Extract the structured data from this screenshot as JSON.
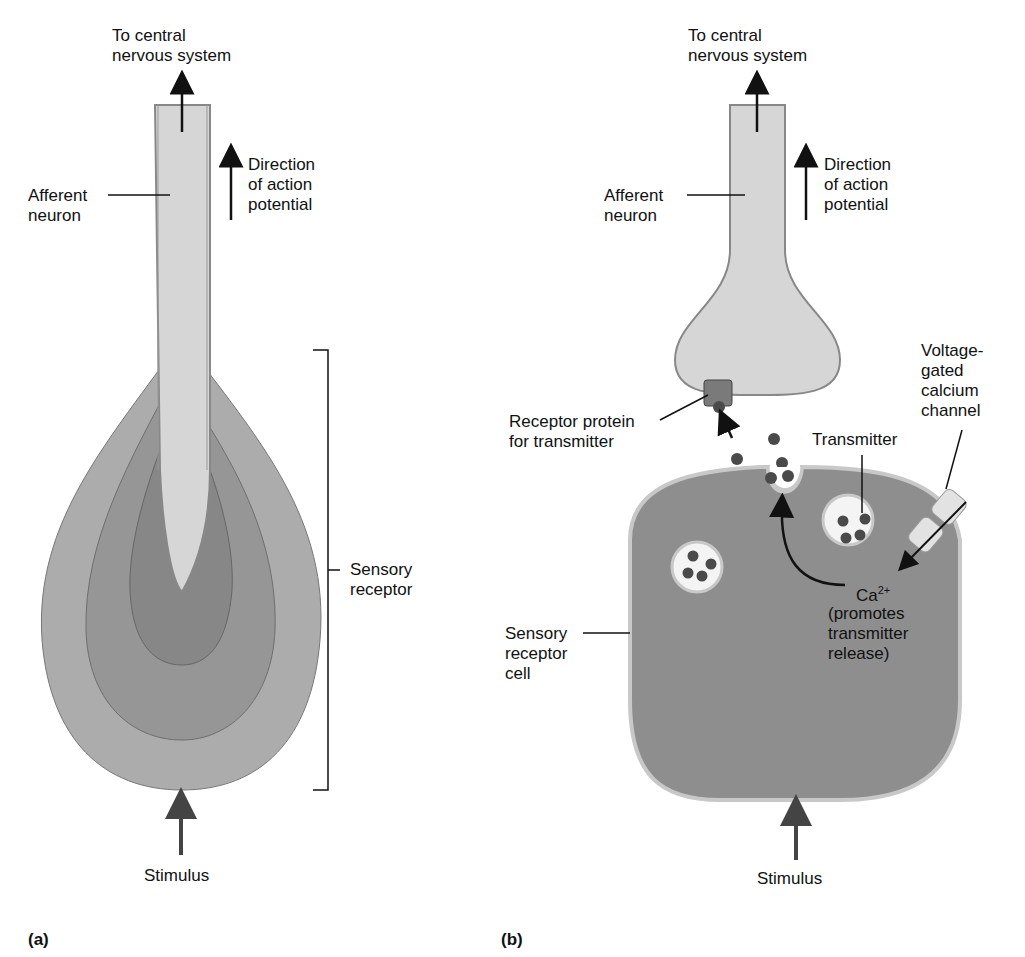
{
  "panel_a": {
    "tag": "(a)",
    "labels": {
      "to_cns": "To central\nnervous system",
      "afferent_neuron": "Afferent\nneuron",
      "direction": "Direction\nof action\npotential",
      "sensory_receptor": "Sensory\nreceptor",
      "stimulus": "Stimulus"
    }
  },
  "panel_b": {
    "tag": "(b)",
    "labels": {
      "to_cns": "To central\nnervous system",
      "afferent_neuron": "Afferent\nneuron",
      "direction": "Direction\nof action\npotential",
      "receptor_protein": "Receptor protein\nfor transmitter",
      "voltage_gated": "Voltage-\ngated\ncalcium\nchannel",
      "transmitter": "Transmitter",
      "ca_base": "Ca",
      "ca_sup": "2+",
      "ca_note": "(promotes\ntransmitter\nrelease)",
      "sensory_receptor_cell": "Sensory\nreceptor\ncell",
      "stimulus": "Stimulus"
    }
  },
  "colors": {
    "neuron_fill": "#d6d6d6",
    "layer_outer": "#a9a9a9",
    "layer_mid": "#939393",
    "layer_inner": "#858585",
    "cell_fill": "#8e8e8e",
    "membrane": "#c8c8c8",
    "dot": "#4a4a4a"
  }
}
